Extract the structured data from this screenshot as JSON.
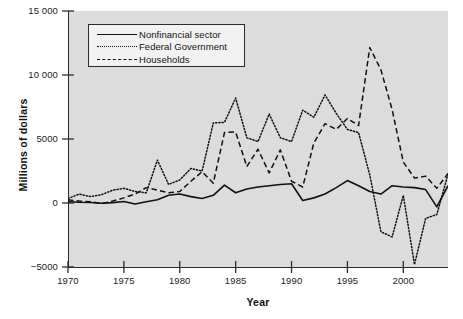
{
  "chart_data": {
    "type": "line",
    "title": "",
    "xlabel": "Year",
    "ylabel": "Millions of dollars",
    "xlim": [
      1970,
      2004
    ],
    "ylim": [
      -5000,
      15000
    ],
    "grid": false,
    "legend_position": "top-left",
    "xticks": [
      "1970",
      "1975",
      "1980",
      "1985",
      "1990",
      "1995",
      "2000"
    ],
    "xtick_values": [
      1970,
      1975,
      1980,
      1985,
      1990,
      1995,
      2000
    ],
    "yticks": [
      "15 000",
      "10 000",
      "5000",
      "0",
      "-5000"
    ],
    "ytick_values": [
      15000,
      10000,
      5000,
      0,
      -5000
    ],
    "x": [
      1970,
      1971,
      1972,
      1973,
      1974,
      1975,
      1976,
      1977,
      1978,
      1979,
      1980,
      1981,
      1982,
      1983,
      1984,
      1985,
      1986,
      1987,
      1988,
      1989,
      1990,
      1991,
      1992,
      1993,
      1994,
      1995,
      1996,
      1997,
      1998,
      1999,
      2000,
      2001,
      2002,
      2003,
      2004
    ],
    "series": [
      {
        "name": "Nonfinancial sector",
        "style": "solid",
        "color": "#111111",
        "values": [
          100,
          60,
          40,
          -20,
          30,
          120,
          -80,
          100,
          250,
          600,
          700,
          500,
          350,
          600,
          1400,
          800,
          1100,
          1250,
          1350,
          1450,
          1500,
          200,
          400,
          700,
          1200,
          1750,
          1350,
          900,
          700,
          1350,
          1250,
          1200,
          1050,
          -300,
          1350
        ]
      },
      {
        "name": "Federal Government",
        "style": "dotted",
        "color": "#111111",
        "values": [
          350,
          700,
          500,
          650,
          1000,
          1150,
          900,
          800,
          3350,
          1450,
          1800,
          2700,
          2500,
          6250,
          6300,
          8200,
          5100,
          4800,
          6950,
          5100,
          4800,
          7250,
          6700,
          8450,
          7000,
          5750,
          5500,
          2200,
          -2250,
          -2650,
          600,
          -4800,
          -1200,
          -900,
          2250
        ]
      },
      {
        "name": "Households",
        "style": "dashed",
        "color": "#111111",
        "values": [
          250,
          150,
          100,
          -50,
          150,
          400,
          700,
          1200,
          1000,
          800,
          900,
          1700,
          2450,
          1550,
          5500,
          5550,
          2850,
          4200,
          2350,
          4150,
          1700,
          1250,
          4700,
          6200,
          5750,
          6600,
          6050,
          12150,
          10400,
          7300,
          3200,
          1950,
          2100,
          1150,
          2300
        ]
      }
    ]
  },
  "axis": {
    "y_label": "Millions of dollars",
    "x_label": "Year"
  },
  "legend": {
    "items": [
      {
        "label": "Nonfinancial sector",
        "style": "solid"
      },
      {
        "label": "Federal Government",
        "style": "dotted"
      },
      {
        "label": "Households",
        "style": "dashed"
      }
    ]
  }
}
